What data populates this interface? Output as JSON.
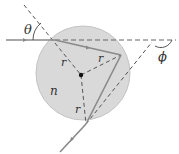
{
  "diagram": {
    "labels": {
      "theta": "θ",
      "phi": "ϕ",
      "index": "n",
      "r1": "r",
      "r2": "r",
      "r3": "r"
    },
    "colors": {
      "sphere_fill": "#d9d9d9",
      "sphere_stroke": "#bdbdbd",
      "ray": "#8a8a8a",
      "dashed": "#555555",
      "text": "#333333"
    }
  }
}
